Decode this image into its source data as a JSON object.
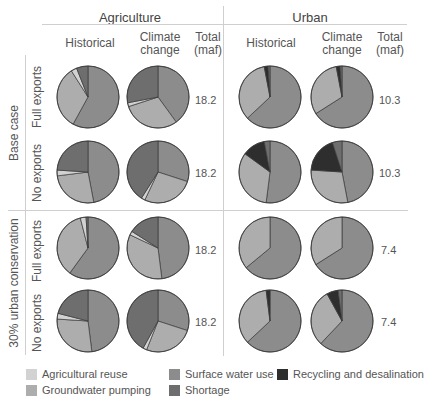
{
  "headers": {
    "agriculture": "Agriculture",
    "urban": "Urban",
    "historical": "Historical",
    "climate_line1": "Climate",
    "climate_line2": "change",
    "total_line1": "Total",
    "total_line2": "(maf)"
  },
  "row_groups": {
    "base_case": "Base case",
    "conservation": "30% urban conservation",
    "full_exports": "Full exports",
    "no_exports": "No exports"
  },
  "totals": {
    "ag_base_full": "18.2",
    "ag_base_no": "18.2",
    "ag_cons_full": "18.2",
    "ag_cons_no": "18.2",
    "urb_base_full": "10.3",
    "urb_base_no": "10.3",
    "urb_cons_full": "7.4",
    "urb_cons_no": "7.4"
  },
  "legend": [
    {
      "label": "Agricultural reuse",
      "color": "#d2d2d2"
    },
    {
      "label": "Groundwater pumping",
      "color": "#adadad"
    },
    {
      "label": "Surface water use",
      "color": "#8c8c8c"
    },
    {
      "label": "Shortage",
      "color": "#6e6e6e"
    },
    {
      "label": "Recycling and desalination",
      "color": "#2e2e2e"
    }
  ],
  "chart_data": {
    "type": "pie",
    "categories": [
      "Surface water use",
      "Groundwater pumping",
      "Agricultural reuse",
      "Recycling and desalination",
      "Shortage"
    ],
    "colors": {
      "Surface water use": "#8c8c8c",
      "Groundwater pumping": "#adadad",
      "Agricultural reuse": "#d2d2d2",
      "Recycling and desalination": "#2e2e2e",
      "Shortage": "#6e6e6e"
    },
    "pies": [
      {
        "sector": "Agriculture",
        "case": "Base case",
        "exports": "Full exports",
        "climate": "Historical",
        "total_maf": 18.2,
        "slices": {
          "Surface water use": 58,
          "Groundwater pumping": 33,
          "Agricultural reuse": 3,
          "Recycling and desalination": 0,
          "Shortage": 6
        }
      },
      {
        "sector": "Agriculture",
        "case": "Base case",
        "exports": "Full exports",
        "climate": "Climate change",
        "total_maf": 18.2,
        "slices": {
          "Surface water use": 40,
          "Groundwater pumping": 30,
          "Agricultural reuse": 2,
          "Recycling and desalination": 0,
          "Shortage": 28
        }
      },
      {
        "sector": "Agriculture",
        "case": "Base case",
        "exports": "No exports",
        "climate": "Historical",
        "total_maf": 18.2,
        "slices": {
          "Surface water use": 47,
          "Groundwater pumping": 26,
          "Agricultural reuse": 3,
          "Recycling and desalination": 0,
          "Shortage": 24
        }
      },
      {
        "sector": "Agriculture",
        "case": "Base case",
        "exports": "No exports",
        "climate": "Climate change",
        "total_maf": 18.2,
        "slices": {
          "Surface water use": 30,
          "Groundwater pumping": 27,
          "Agricultural reuse": 2,
          "Recycling and desalination": 0,
          "Shortage": 41
        }
      },
      {
        "sector": "Urban",
        "case": "Base case",
        "exports": "Full exports",
        "climate": "Historical",
        "total_maf": 10.3,
        "slices": {
          "Surface water use": 63,
          "Groundwater pumping": 34,
          "Agricultural reuse": 0,
          "Recycling and desalination": 2,
          "Shortage": 1
        }
      },
      {
        "sector": "Urban",
        "case": "Base case",
        "exports": "Full exports",
        "climate": "Climate change",
        "total_maf": 10.3,
        "slices": {
          "Surface water use": 66,
          "Groundwater pumping": 31,
          "Agricultural reuse": 0,
          "Recycling and desalination": 2,
          "Shortage": 1
        }
      },
      {
        "sector": "Urban",
        "case": "Base case",
        "exports": "No exports",
        "climate": "Historical",
        "total_maf": 10.3,
        "slices": {
          "Surface water use": 52,
          "Groundwater pumping": 33,
          "Agricultural reuse": 0,
          "Recycling and desalination": 12,
          "Shortage": 3
        }
      },
      {
        "sector": "Urban",
        "case": "Base case",
        "exports": "No exports",
        "climate": "Climate change",
        "total_maf": 10.3,
        "slices": {
          "Surface water use": 47,
          "Groundwater pumping": 29,
          "Agricultural reuse": 0,
          "Recycling and desalination": 19,
          "Shortage": 5
        }
      },
      {
        "sector": "Agriculture",
        "case": "30% urban conservation",
        "exports": "Full exports",
        "climate": "Historical",
        "total_maf": 18.2,
        "slices": {
          "Surface water use": 60,
          "Groundwater pumping": 36,
          "Agricultural reuse": 3,
          "Recycling and desalination": 0,
          "Shortage": 1
        }
      },
      {
        "sector": "Agriculture",
        "case": "30% urban conservation",
        "exports": "Full exports",
        "climate": "Climate change",
        "total_maf": 18.2,
        "slices": {
          "Surface water use": 48,
          "Groundwater pumping": 34,
          "Agricultural reuse": 2,
          "Recycling and desalination": 0,
          "Shortage": 16
        }
      },
      {
        "sector": "Agriculture",
        "case": "30% urban conservation",
        "exports": "No exports",
        "climate": "Historical",
        "total_maf": 18.2,
        "slices": {
          "Surface water use": 48,
          "Groundwater pumping": 28,
          "Agricultural reuse": 3,
          "Recycling and desalination": 0,
          "Shortage": 21
        }
      },
      {
        "sector": "Agriculture",
        "case": "30% urban conservation",
        "exports": "No exports",
        "climate": "Climate change",
        "total_maf": 18.2,
        "slices": {
          "Surface water use": 30,
          "Groundwater pumping": 26,
          "Agricultural reuse": 2,
          "Recycling and desalination": 0,
          "Shortage": 42
        }
      },
      {
        "sector": "Urban",
        "case": "30% urban conservation",
        "exports": "Full exports",
        "climate": "Historical",
        "total_maf": 7.4,
        "slices": {
          "Surface water use": 64,
          "Groundwater pumping": 36,
          "Agricultural reuse": 0,
          "Recycling and desalination": 0,
          "Shortage": 0
        }
      },
      {
        "sector": "Urban",
        "case": "30% urban conservation",
        "exports": "Full exports",
        "climate": "Climate change",
        "total_maf": 7.4,
        "slices": {
          "Surface water use": 66,
          "Groundwater pumping": 34,
          "Agricultural reuse": 0,
          "Recycling and desalination": 0,
          "Shortage": 0
        }
      },
      {
        "sector": "Urban",
        "case": "30% urban conservation",
        "exports": "No exports",
        "climate": "Historical",
        "total_maf": 7.4,
        "slices": {
          "Surface water use": 63,
          "Groundwater pumping": 35,
          "Agricultural reuse": 0,
          "Recycling and desalination": 2,
          "Shortage": 0
        }
      },
      {
        "sector": "Urban",
        "case": "30% urban conservation",
        "exports": "No exports",
        "climate": "Climate change",
        "total_maf": 7.4,
        "slices": {
          "Surface water use": 62,
          "Groundwater pumping": 30,
          "Agricultural reuse": 0,
          "Recycling and desalination": 6,
          "Shortage": 2
        }
      }
    ]
  }
}
